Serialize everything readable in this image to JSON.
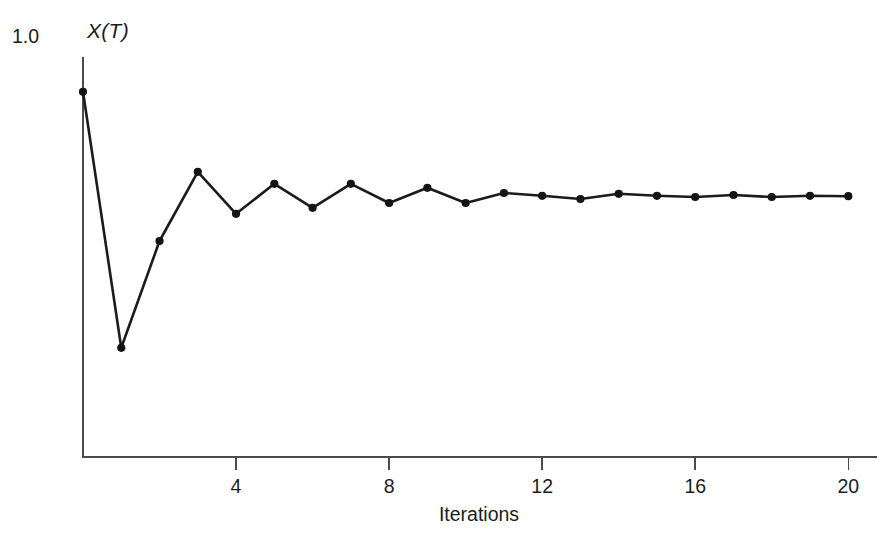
{
  "chart_data": {
    "type": "line",
    "title": "",
    "subtitle": "",
    "xlabel": "Iterations",
    "ylabel": "X(T)",
    "ylabel_display": "X(T)",
    "ymax_label": "1.0",
    "xlim": [
      0,
      20.75
    ],
    "ylim": [
      0.0,
      1.0
    ],
    "grid": false,
    "legend": null,
    "xticks": [
      4,
      8,
      12,
      16,
      20
    ],
    "xtick_labels": [
      "4",
      "8",
      "12",
      "16",
      "20"
    ],
    "yticks": [
      1.0
    ],
    "ytick_labels": [
      "1.0"
    ],
    "marker": "filled-circle",
    "line_color": "#1b1b1b",
    "marker_color": "#141414",
    "axis_color": "#4b4b4b",
    "background_color": "#ffffff",
    "x": [
      0,
      1,
      2,
      3,
      4,
      5,
      6,
      7,
      8,
      9,
      10,
      11,
      12,
      13,
      14,
      15,
      16,
      17,
      18,
      19,
      20
    ],
    "values": [
      0.913,
      0.273,
      0.54,
      0.713,
      0.608,
      0.683,
      0.623,
      0.683,
      0.635,
      0.673,
      0.635,
      0.66,
      0.653,
      0.645,
      0.658,
      0.653,
      0.65,
      0.655,
      0.65,
      0.653,
      0.652
    ],
    "series": [
      {
        "name": "X(T)",
        "values": [
          0.913,
          0.273,
          0.54,
          0.713,
          0.608,
          0.683,
          0.623,
          0.683,
          0.635,
          0.673,
          0.635,
          0.66,
          0.653,
          0.645,
          0.658,
          0.653,
          0.65,
          0.655,
          0.65,
          0.653,
          0.652
        ]
      }
    ]
  }
}
